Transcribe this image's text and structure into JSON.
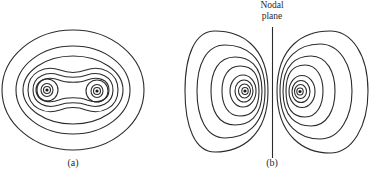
{
  "figure": {
    "panel_a": {
      "label": "(a)"
    },
    "panel_b": {
      "label": "(b)",
      "annotation_line1": "Nodal",
      "annotation_line2": "plane"
    }
  },
  "colors": {
    "line": "#2b2b2b",
    "background": "#ffffff"
  }
}
